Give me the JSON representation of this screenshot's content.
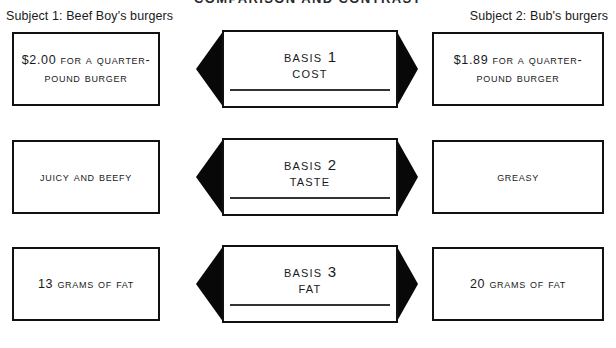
{
  "title": "COMPARISON AND CONTRAST",
  "headers": {
    "left": "Subject 1: Beef Boy's burgers",
    "right": "Subject 2: Bub's burgers"
  },
  "rows": [
    {
      "left": "$2.00 for a quarter-pound burger",
      "basis_label": "Basis",
      "basis_number": "1",
      "basis_name": "Cost",
      "right": "$1.89 for a quarter-pound burger"
    },
    {
      "left": "Juicy and beefy",
      "basis_label": "Basis",
      "basis_number": "2",
      "basis_name": "Taste",
      "right": "Greasy"
    },
    {
      "left": "13 grams of fat",
      "basis_label": "Basis",
      "basis_number": "3",
      "basis_name": "Fat",
      "right": "20 grams of fat"
    }
  ],
  "colors": {
    "ink": "#111111",
    "arrow_fill": "#080808",
    "background": "#ffffff"
  }
}
